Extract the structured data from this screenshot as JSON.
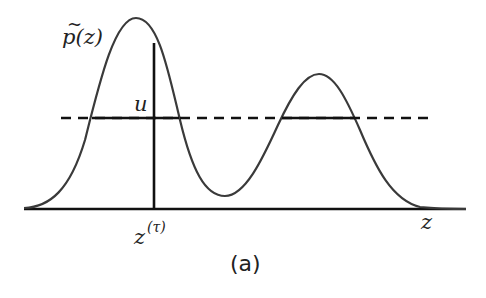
{
  "figure": {
    "caption": "(a)",
    "labels": {
      "density": "p(z)",
      "density_tilde": "~",
      "threshold": "u",
      "sample_base": "z",
      "sample_sup": "(τ)",
      "axis": "z"
    },
    "colors": {
      "curve": "#3a3a3a",
      "axis": "#111111",
      "dashed": "#111111",
      "vertical": "#111111",
      "text": "#222222"
    },
    "geometry": {
      "baseline_y": 209,
      "baseline_x": [
        24,
        466
      ],
      "peak1": {
        "x": 136,
        "y": 18
      },
      "peak2": {
        "x": 319,
        "y": 74
      },
      "valley": {
        "x": 225,
        "y": 196
      },
      "threshold_y": 118,
      "threshold_x": [
        61,
        428
      ],
      "sample_x": 154,
      "sample_top_y": 43
    }
  }
}
